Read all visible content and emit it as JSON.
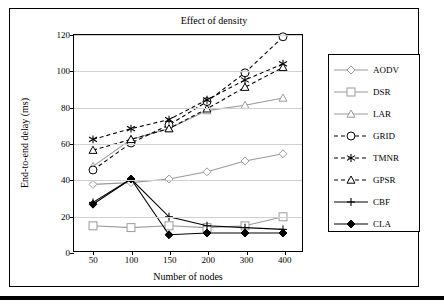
{
  "chart_data": {
    "type": "line",
    "title": "Effect of density",
    "xlabel": "Number of nodes",
    "ylabel": "End-to-end delay (ms)",
    "categories": [
      50,
      100,
      150,
      200,
      300,
      400
    ],
    "xtick_labels": [
      "50",
      "100",
      "150",
      "200",
      "300",
      "400"
    ],
    "ytick_labels": [
      "0",
      "20",
      "40",
      "60",
      "80",
      "100",
      "120"
    ],
    "ylim": [
      0,
      120
    ],
    "ytick_step": 20,
    "grid": true,
    "legend_position": "right",
    "series": [
      {
        "name": "AODV",
        "values": [
          37,
          38,
          40,
          44,
          50,
          54
        ],
        "marker": "diamond-open",
        "line": "solid",
        "color": "#9a9a9a"
      },
      {
        "name": "DSR",
        "values": [
          14,
          13,
          14,
          13,
          14,
          19
        ],
        "marker": "square-open",
        "line": "solid",
        "color": "#9a9a9a"
      },
      {
        "name": "LAR",
        "values": [
          47,
          62,
          68,
          78,
          81,
          85
        ],
        "marker": "triangle-open",
        "line": "solid",
        "color": "#9a9a9a"
      },
      {
        "name": "GRID",
        "values": [
          45,
          60,
          70,
          83,
          99,
          119
        ],
        "marker": "circle-open",
        "line": "dashed",
        "color": "#000000"
      },
      {
        "name": "TMNR",
        "values": [
          62,
          68,
          73,
          84,
          95,
          104
        ],
        "marker": "asterisk",
        "line": "dashed",
        "color": "#000000"
      },
      {
        "name": "GPSR",
        "values": [
          56,
          62,
          68,
          79,
          91,
          102
        ],
        "marker": "triangle-open",
        "line": "dashed",
        "color": "#000000"
      },
      {
        "name": "CBF",
        "values": [
          27,
          40,
          19,
          14,
          13,
          12
        ],
        "marker": "plus",
        "line": "solid",
        "color": "#000000"
      },
      {
        "name": "CLA",
        "values": [
          26,
          40,
          9,
          10,
          10,
          10
        ],
        "marker": "diamond-solid",
        "line": "solid",
        "color": "#000000"
      }
    ]
  },
  "legend": {
    "items": [
      {
        "label": "AODV"
      },
      {
        "label": "DSR"
      },
      {
        "label": "LAR"
      },
      {
        "label": "GRID"
      },
      {
        "label": "TMNR"
      },
      {
        "label": "GPSR"
      },
      {
        "label": "CBF"
      },
      {
        "label": "CLA"
      }
    ]
  }
}
